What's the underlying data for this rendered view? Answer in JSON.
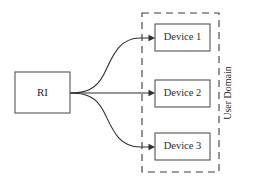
{
  "canvas": {
    "width": 253,
    "height": 184,
    "background": "#ffffff",
    "line_color": "#2f2f2f",
    "box_stroke_color": "#545454",
    "text_color": "#2b2b2b"
  },
  "diagram": {
    "title": "",
    "type": "block-diagram",
    "source_node": {
      "id": "ri",
      "label": "RI",
      "x": 15,
      "y": 72,
      "width": 55,
      "height": 41
    },
    "group": {
      "id": "user-domain",
      "label": "User Domain",
      "label_orientation": "vertical",
      "x": 142,
      "y": 13,
      "width": 77,
      "height": 159,
      "style": "dashed"
    },
    "nodes": [
      {
        "id": "device-1",
        "label": "Device 1",
        "x": 155,
        "y": 24,
        "width": 55,
        "height": 27
      },
      {
        "id": "device-2",
        "label": "Device 2",
        "x": 155,
        "y": 80,
        "width": 55,
        "height": 27
      },
      {
        "id": "device-3",
        "label": "Device 3",
        "x": 155,
        "y": 133,
        "width": 55,
        "height": 27
      }
    ],
    "edges": [
      {
        "id": "edge-ri-device-1",
        "from": "ri",
        "to": "device-1",
        "shape": "s-curve-up",
        "arrow": true,
        "path": "M 70 93 C 85 93, 96 90, 104 74 C 112 58, 118 38, 140 38 L 153.5 38"
      },
      {
        "id": "edge-ri-device-2",
        "from": "ri",
        "to": "device-2",
        "shape": "straight",
        "arrow": true,
        "path": "M 70 93 L 153.5 93"
      },
      {
        "id": "edge-ri-device-3",
        "from": "ri",
        "to": "device-3",
        "shape": "s-curve-down",
        "arrow": true,
        "path": "M 70 93 C 85 93, 96 96, 104 112 C 112 128, 118 147, 140 147 L 153.5 147"
      }
    ],
    "arrow_tips": [
      {
        "id": "arrow-device-1",
        "x": 155,
        "y": 38
      },
      {
        "id": "arrow-device-2",
        "x": 155,
        "y": 93
      },
      {
        "id": "arrow-device-3",
        "x": 155,
        "y": 147
      }
    ]
  }
}
